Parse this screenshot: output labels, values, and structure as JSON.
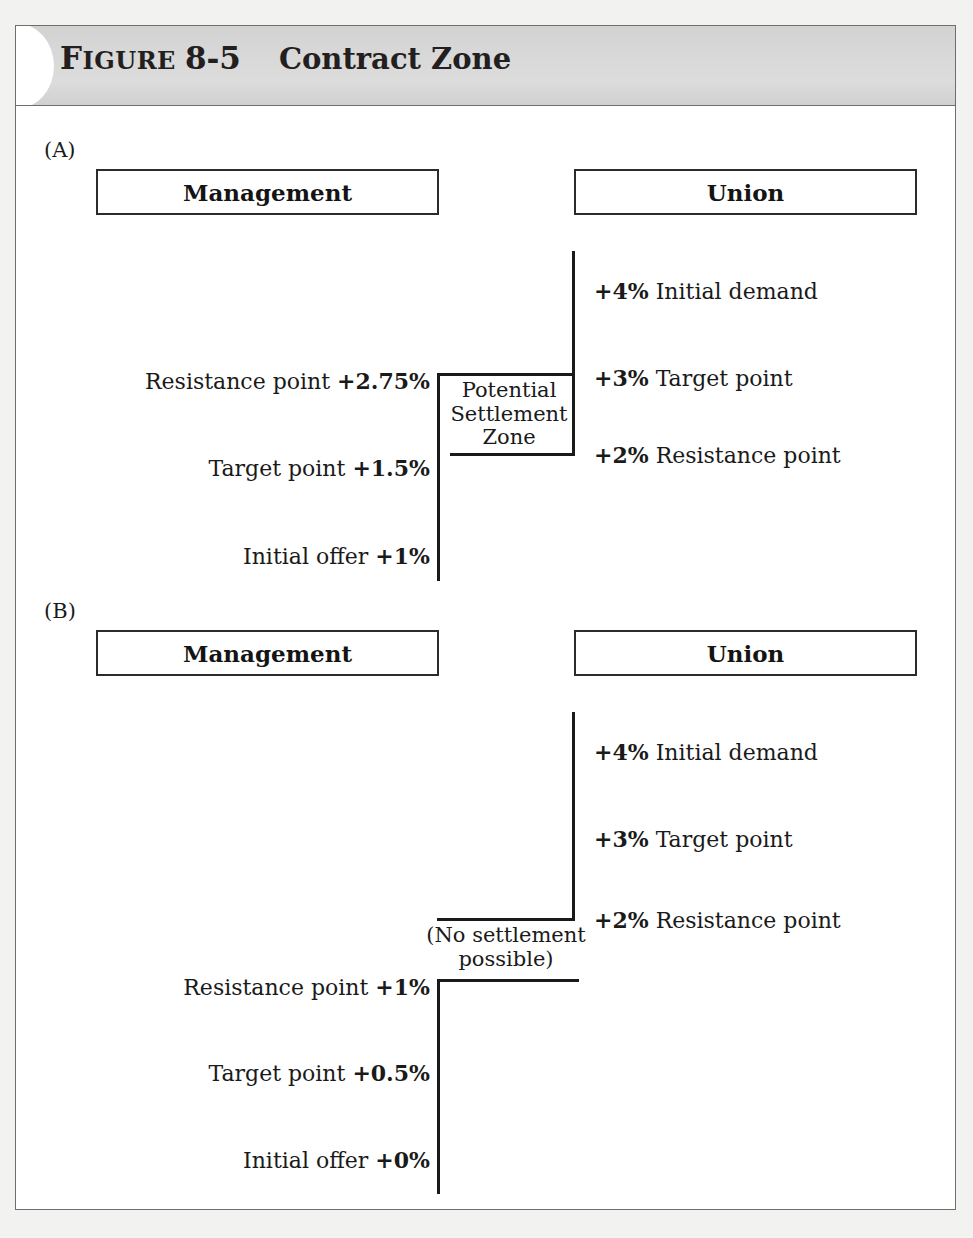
{
  "header": {
    "kicker_first": "F",
    "kicker_rest": "IGURE",
    "number": "8-5",
    "title": "Contract Zone"
  },
  "panels": [
    {
      "label": "(A)",
      "management": {
        "box_title": "Management",
        "points": [
          {
            "name": "Resistance point",
            "value": "+2.75%"
          },
          {
            "name": "Target point",
            "value": "+1.5%"
          },
          {
            "name": "Initial offer",
            "value": "+1%"
          }
        ]
      },
      "union": {
        "box_title": "Union",
        "points": [
          {
            "value": "+4%",
            "name": "Initial demand"
          },
          {
            "value": "+3%",
            "name": "Target point"
          },
          {
            "value": "+2%",
            "name": "Resistance point"
          }
        ]
      },
      "annotation": {
        "line1": "Potential",
        "line2": "Settlement",
        "line3": "Zone"
      }
    },
    {
      "label": "(B)",
      "management": {
        "box_title": "Management",
        "points": [
          {
            "name": "Resistance point",
            "value": "+1%"
          },
          {
            "name": "Target point",
            "value": "+0.5%"
          },
          {
            "name": "Initial offer",
            "value": "+0%"
          }
        ]
      },
      "union": {
        "box_title": "Union",
        "points": [
          {
            "value": "+4%",
            "name": "Initial demand"
          },
          {
            "value": "+3%",
            "name": "Target point"
          },
          {
            "value": "+2%",
            "name": "Resistance point"
          }
        ]
      },
      "annotation": {
        "line1": "(No settlement",
        "line2": "possible)"
      }
    }
  ],
  "colors": {
    "header_band": "#d8d8d8",
    "frame_border": "#6e6e6e",
    "ink": "#1a1a1a",
    "page_background": "#f2f2f0"
  }
}
